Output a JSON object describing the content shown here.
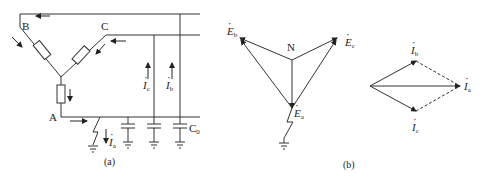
{
  "figure_a": {
    "caption": "(a)",
    "nodes": {
      "B": "B",
      "C": "C",
      "A": "A"
    },
    "currents": {
      "Ic": {
        "sym": "I",
        "sub": "c"
      },
      "Ib": {
        "sym": "I",
        "sub": "b"
      },
      "Ia": {
        "sym": "I",
        "sub": "a"
      }
    },
    "capacitor_label": {
      "sym": "C",
      "sub": "0"
    }
  },
  "figure_b": {
    "caption": "(b)",
    "neutral": "N",
    "emf": {
      "Eb": {
        "sym": "E",
        "sub": "b"
      },
      "Ec": {
        "sym": "E",
        "sub": "c"
      },
      "Ea": {
        "sym": "E",
        "sub": "a"
      }
    },
    "phasors": {
      "Ib": {
        "sym": "I",
        "sub": "b"
      },
      "Ia": {
        "sym": "I",
        "sub": "a"
      },
      "Ic": {
        "sym": "I",
        "sub": "c"
      }
    }
  },
  "colors": {
    "line": "#333333",
    "background": "#ffffff"
  }
}
